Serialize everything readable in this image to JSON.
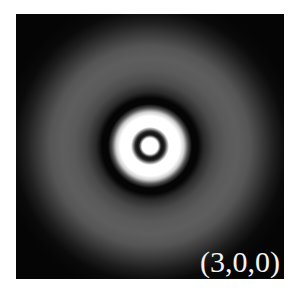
{
  "figure": {
    "label": "(3,0,0)",
    "background_color": "#050505",
    "label_color": "#f2f2f2"
  }
}
